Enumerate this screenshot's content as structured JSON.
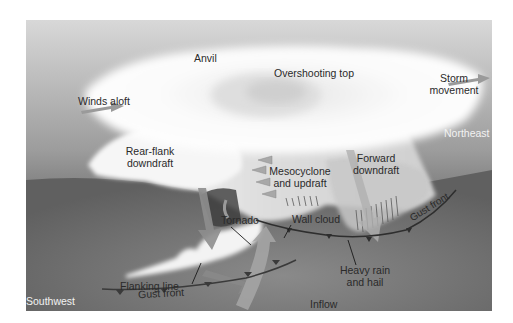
{
  "diagram": {
    "labels": {
      "anvil": "Anvil",
      "winds_aloft": "Winds aloft",
      "overshooting_top": "Overshooting top",
      "storm_movement_line1": "Storm",
      "storm_movement_line2": "movement",
      "northeast": "Northeast",
      "rear_flank_line1": "Rear-flank",
      "rear_flank_line2": "downdraft",
      "mesocyclone_line1": "Mesocyclone",
      "mesocyclone_line2": "and updraft",
      "forward_line1": "Forward",
      "forward_line2": "downdraft",
      "tornado": "Tornado",
      "wall_cloud": "Wall cloud",
      "flanking_line": "Flanking line",
      "gust_front_right": "Gust front",
      "heavy_rain_line1": "Heavy rain",
      "heavy_rain_line2": "and hail",
      "gust_front_bottom": "Gust front",
      "southwest": "Southwest",
      "inflow": "Inflow"
    },
    "colors": {
      "sky_top": "#d6d6d6",
      "sky_bottom": "#5a5a5a",
      "ground": "#707070",
      "cloud": "#f7f7f7",
      "arrow": "#9a9a9a",
      "front_line": "#3a3a3a"
    }
  }
}
